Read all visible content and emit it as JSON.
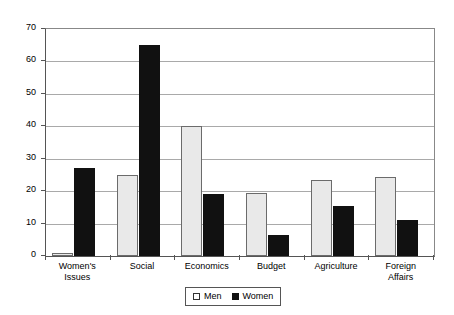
{
  "chart_data": {
    "type": "bar",
    "title": "",
    "subtitle": "",
    "xlabel": "",
    "ylabel": "",
    "ylim": [
      0,
      70
    ],
    "yticks": [
      0,
      10,
      20,
      30,
      40,
      50,
      60,
      70
    ],
    "ytick_labels": [
      "0",
      "10",
      "20",
      "30",
      "40",
      "50",
      "60",
      "70"
    ],
    "grid": true,
    "legend_position": "bottom-center",
    "categories": [
      "Women's Issues",
      "Social",
      "Economics",
      "Budget",
      "Agriculture",
      "Foreign Affairs"
    ],
    "category_lines": [
      [
        "Women's",
        "Issues"
      ],
      [
        "Social"
      ],
      [
        "Economics"
      ],
      [
        "Budget"
      ],
      [
        "Agriculture"
      ],
      [
        "Foreign",
        "Affairs"
      ]
    ],
    "series": [
      {
        "name": "Men",
        "color": "#e9e9e9",
        "values": [
          1,
          25,
          40,
          19.5,
          23.5,
          24.5
        ]
      },
      {
        "name": "Women",
        "color": "#111111",
        "values": [
          27,
          65,
          19,
          6.5,
          15.5,
          11
        ]
      }
    ]
  },
  "legend": {
    "items": [
      {
        "label": "Men",
        "swatch": "open-square-swatch"
      },
      {
        "label": "Women",
        "swatch": "filled-square-swatch"
      }
    ]
  }
}
